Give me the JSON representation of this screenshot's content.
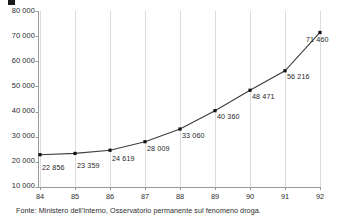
{
  "chart_data": {
    "type": "line",
    "title": "",
    "subtitle": "",
    "xlabel": "",
    "ylabel": "",
    "categories": [
      "84",
      "85",
      "86",
      "87",
      "88",
      "89",
      "90",
      "91",
      "92"
    ],
    "values": [
      22856,
      23359,
      24619,
      28009,
      33060,
      40360,
      48471,
      56216,
      71460
    ],
    "point_labels": [
      "22 856",
      "23 359",
      "24 619",
      "28 009",
      "33 060",
      "40 360",
      "48 471",
      "56 216",
      "71 460"
    ],
    "ylim": [
      10000,
      80000
    ],
    "yticks": [
      10000,
      20000,
      30000,
      40000,
      50000,
      60000,
      70000,
      80000
    ],
    "ytick_labels": [
      "10 000",
      "20 000",
      "30 000",
      "40 000",
      "50 000",
      "60 000",
      "70 000",
      "80 000"
    ],
    "xtick_labels": [
      "84",
      "85",
      "86",
      "87",
      "88",
      "89",
      "90",
      "91",
      "92"
    ],
    "grid": true,
    "grid_axis": "x",
    "legend": [],
    "marker": "square",
    "line_color": "#3d3d3d",
    "marker_color": "#111111",
    "grid_color": "#dcdcdc",
    "axis_color": "#9a9a9a"
  },
  "legend_marker": {
    "icon": "square-marker-icon",
    "color": "#1a1a1a"
  },
  "footer": {
    "source": "Fonte: Ministero dell'Interno, Osservatorio permanente sul fenomeno droga."
  }
}
